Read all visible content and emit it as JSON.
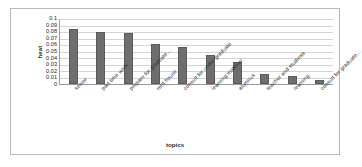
{
  "chart_data": {
    "type": "bar",
    "title": "",
    "xlabel": "topics",
    "ylabel": "heat",
    "categories": [
      "senior",
      "part time work",
      "prepare for graduate...",
      "rent house",
      "consult for under graduate",
      "learning material",
      "alumnus",
      "teacher and students",
      "learning",
      "consult for graduate..."
    ],
    "values": [
      0.085,
      0.08,
      0.078,
      0.062,
      0.057,
      0.045,
      0.034,
      0.016,
      0.012,
      0.006
    ],
    "ylim": [
      0,
      0.1
    ],
    "ytick_labels": [
      "0.1",
      "0.09",
      "0.08",
      "0.07",
      "0.06",
      "0.05",
      "0.04",
      "0.03",
      "0.02",
      "0.01",
      "0"
    ],
    "ytick_values": [
      0.1,
      0.09,
      0.08,
      0.07,
      0.06,
      0.05,
      0.04,
      0.03,
      0.02,
      0.01,
      0
    ],
    "grid": true,
    "legend": false,
    "series_color": "#6e6e6e",
    "grid_color": "#d4d4d4",
    "axis_color": "#9a9a9a",
    "border_color": "#b9b9b9"
  }
}
